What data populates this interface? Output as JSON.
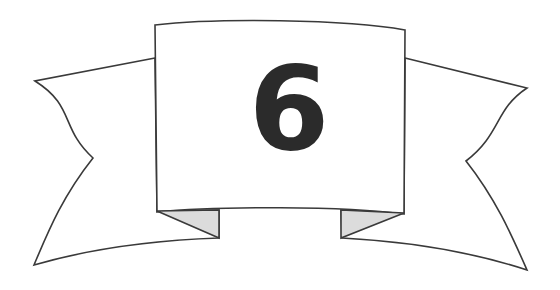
{
  "graphic": {
    "type": "ribbon-banner",
    "title": "Numbered ribbon banner",
    "numeral": "6",
    "colors": {
      "background": "#ffffff",
      "banner_fill": "#ffffff",
      "outline": "#3a3a3a",
      "fold_shadow": "#dcdcdc",
      "numeral": "#2b2b2b"
    },
    "parts": {
      "center_panel_label": "center-panel",
      "left_wing_label": "left-wing",
      "right_wing_label": "right-wing",
      "left_fold_label": "left-fold",
      "right_fold_label": "right-fold"
    },
    "geometry": {
      "canvas": [
        560,
        290
      ],
      "center_panel": {
        "top_left": [
          155,
          25
        ],
        "top_right": [
          405,
          30
        ],
        "top_arc_peak": [
          280,
          19
        ],
        "bottom_left": [
          157,
          212
        ],
        "bottom_right": [
          404,
          214
        ],
        "bottom_arc_dip": [
          280,
          209
        ]
      },
      "left_wing": {
        "attach_top": [
          155,
          58
        ],
        "outer_top": [
          35,
          81
        ],
        "notch_vertex": [
          93,
          158
        ],
        "outer_bottom": [
          34,
          265
        ],
        "attach_bottom": [
          219,
          238
        ]
      },
      "right_wing": {
        "attach_top": [
          405,
          58
        ],
        "outer_top": [
          527,
          88
        ],
        "notch_vertex": [
          466,
          161
        ],
        "outer_bottom": [
          527,
          270
        ],
        "attach_bottom": [
          342,
          238
        ]
      },
      "left_fold": [
        [
          157,
          211
        ],
        [
          219,
          210
        ],
        [
          219,
          238
        ]
      ],
      "right_fold": [
        [
          404,
          213
        ],
        [
          341,
          210
        ],
        [
          341,
          238
        ]
      ],
      "numeral_center": [
        289,
        103
      ],
      "numeral_bowl_center": [
        288,
        123
      ],
      "numeral_bowl_outer_radius": 28,
      "numeral_bowl_inner_radius": 10
    }
  }
}
